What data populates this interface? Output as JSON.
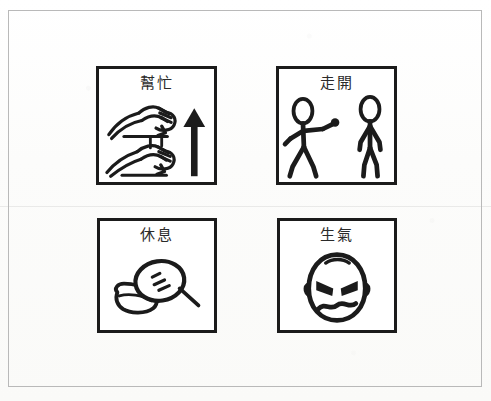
{
  "page": {
    "background_color": "#fdfdfc",
    "frame_color": "#b9b9b9",
    "ink_color": "#1b1b1b"
  },
  "cards": [
    {
      "id": "help",
      "label": "幫忙",
      "meaning": "help",
      "art_name": "two-hands-gripping-with-up-arrow",
      "art_elements": [
        "upper-hand-fist",
        "lower-hand-fist",
        "upward-arrow"
      ]
    },
    {
      "id": "go-away",
      "label": "走開",
      "meaning": "go away",
      "art_name": "two-stick-figures-one-pointing-away",
      "art_elements": [
        "walking-stick-figure-pointing",
        "standing-stick-figure"
      ]
    },
    {
      "id": "rest",
      "label": "休息",
      "meaning": "rest",
      "art_name": "head-resting-on-pillow",
      "art_elements": [
        "sleeping-head",
        "closed-eye-lashes",
        "pillow"
      ]
    },
    {
      "id": "angry",
      "label": "生氣",
      "meaning": "angry",
      "art_name": "angry-face",
      "art_elements": [
        "angled-eyebrows-eyes",
        "wavy-frown-mouth",
        "ears",
        "hair-tuft"
      ]
    }
  ]
}
